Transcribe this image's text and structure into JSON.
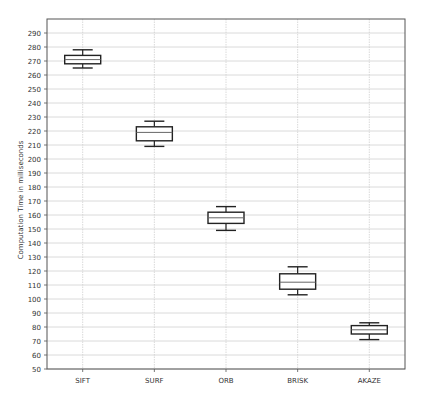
{
  "chart_data": {
    "type": "box",
    "title": "",
    "xlabel": "",
    "ylabel": "Computation Time in milliseconds",
    "ylim": [
      50,
      300
    ],
    "yticks": [
      50,
      60,
      70,
      80,
      90,
      100,
      110,
      120,
      130,
      140,
      150,
      160,
      170,
      180,
      190,
      200,
      210,
      220,
      230,
      240,
      250,
      260,
      270,
      280,
      290
    ],
    "grid": true,
    "legend": null,
    "categories": [
      "SIFT",
      "SURF",
      "ORB",
      "BRISK",
      "AKAZE"
    ],
    "series": [
      {
        "name": "SIFT",
        "whisker_low": 265,
        "q1": 268,
        "median": 271,
        "q3": 274,
        "whisker_high": 278
      },
      {
        "name": "SURF",
        "whisker_low": 209,
        "q1": 213,
        "median": 219,
        "q3": 223,
        "whisker_high": 227
      },
      {
        "name": "ORB",
        "whisker_low": 149,
        "q1": 154,
        "median": 158,
        "q3": 162,
        "whisker_high": 166
      },
      {
        "name": "BRISK",
        "whisker_low": 103,
        "q1": 107,
        "median": 112,
        "q3": 118,
        "whisker_high": 123
      },
      {
        "name": "AKAZE",
        "whisker_low": 71,
        "q1": 75,
        "median": 78,
        "q3": 81,
        "whisker_high": 83
      }
    ]
  },
  "colors": {
    "background": "#ffffff",
    "frame": "#555555",
    "grid": "#d0d0d0",
    "box": "#222222",
    "median": "#666666",
    "text": "#333333"
  }
}
